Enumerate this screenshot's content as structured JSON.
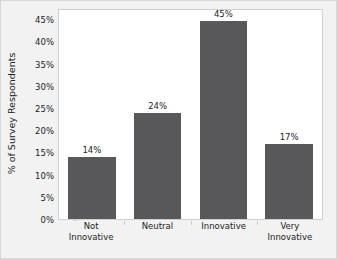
{
  "chart_data": {
    "type": "bar",
    "title": "",
    "xlabel": "",
    "ylabel": "% of Survey Respondents",
    "categories": [
      "Not Innovative",
      "Neutral",
      "Innovative",
      "Very Innovative"
    ],
    "category_lines": [
      [
        "Not",
        "Innovative"
      ],
      [
        "Neutral"
      ],
      [
        "Innovative"
      ],
      [
        "Very",
        "Innovative"
      ]
    ],
    "values": [
      14,
      24,
      45,
      17
    ],
    "value_labels": [
      "14%",
      "24%",
      "45%",
      "17%"
    ],
    "ylim": [
      0,
      47.5
    ],
    "ytick_values": [
      0,
      5,
      10,
      15,
      20,
      25,
      30,
      35,
      40,
      45
    ],
    "ytick_labels": [
      "0%",
      "5%",
      "10%",
      "15%",
      "20%",
      "25%",
      "30%",
      "35%",
      "40%",
      "45%"
    ],
    "grid": false,
    "legend": false,
    "bar_color": "#58585a",
    "plot_background": "#ffffff",
    "figure_background": "#f2f2f2",
    "axis_color": "#cfcfcf",
    "text_color": "#1c1c1c"
  }
}
